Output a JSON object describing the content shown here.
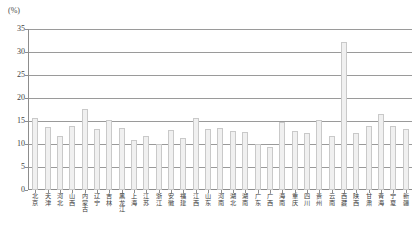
{
  "chart_data": {
    "type": "bar",
    "title": "",
    "subtitle": "",
    "xlabel": "",
    "ylabel": "(%)",
    "unit_label": "(%)",
    "ylim": [
      0,
      35
    ],
    "ytick_step": 5,
    "ytick_labels": [
      "35",
      "30",
      "25",
      "20",
      "15",
      "10",
      "5",
      "0"
    ],
    "ytick_values": [
      35,
      30,
      25,
      20,
      15,
      10,
      5,
      0
    ],
    "grid": true,
    "legend": "none",
    "categories": [
      "北京",
      "天津",
      "河北",
      "山西",
      "内蒙古",
      "辽宁",
      "吉林",
      "黑龙江",
      "上海",
      "江苏",
      "浙江",
      "安徽",
      "福建",
      "江西",
      "山东",
      "河南",
      "湖北",
      "湖南",
      "广东",
      "广西",
      "海南",
      "重庆",
      "四川",
      "贵州",
      "云南",
      "西藏",
      "陕西",
      "甘肃",
      "青海",
      "宁夏",
      "新疆"
    ],
    "values": [
      15.6,
      13.7,
      11.7,
      14.0,
      17.7,
      13.2,
      15.3,
      13.4,
      10.8,
      11.7,
      9.9,
      13.1,
      11.4,
      15.7,
      13.2,
      13.5,
      12.9,
      12.6,
      10.0,
      9.4,
      14.8,
      12.8,
      12.5,
      15.2,
      11.8,
      32.2,
      12.4,
      13.9,
      16.6,
      14.0,
      13.2
    ],
    "bar_fill_color": "#f0f0f0",
    "bar_border_color": "#c9c9c9",
    "axis_color": "#8d8d8d",
    "grid_color": "#9a9a9a"
  }
}
